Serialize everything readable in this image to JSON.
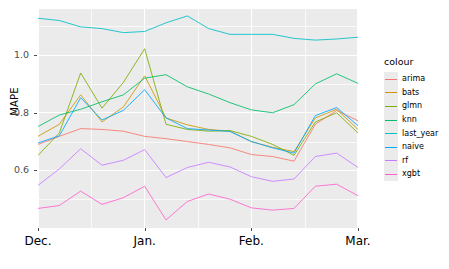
{
  "chart_data": {
    "type": "line",
    "title": "",
    "xlabel": "",
    "ylabel": "MAPE",
    "legend_title": "colour",
    "legend_position": "right",
    "grid": true,
    "ylim": [
      0.4,
      1.16
    ],
    "yticks": [
      0.6,
      0.8,
      1.0
    ],
    "ytick_labels": [
      "0.6",
      "0.8",
      "1.0"
    ],
    "y_minor_ticks": [
      0.5,
      0.7,
      0.9,
      1.1
    ],
    "xticks": [
      "Dec.",
      "Jan.",
      "Feb.",
      "Mar."
    ],
    "xtick_positions": [
      1,
      6,
      11,
      16
    ],
    "x_minor_positions": [
      3.5,
      8.5,
      13.5
    ],
    "x": [
      1,
      2,
      3,
      4,
      5,
      6,
      7,
      8,
      9,
      10,
      11,
      12,
      13,
      14,
      15,
      16
    ],
    "series": [
      {
        "name": "arima",
        "color": "#f8766d",
        "values": [
          0.69,
          0.718,
          0.745,
          0.742,
          0.736,
          0.718,
          0.71,
          0.7,
          0.69,
          0.678,
          0.655,
          0.648,
          0.632,
          0.76,
          0.808,
          0.772
        ]
      },
      {
        "name": "bats",
        "color": "#cd9600",
        "values": [
          0.718,
          0.76,
          0.862,
          0.768,
          0.82,
          0.928,
          0.782,
          0.758,
          0.742,
          0.736,
          0.7,
          0.68,
          0.665,
          0.782,
          0.812,
          0.742
        ]
      },
      {
        "name": "glmn",
        "color": "#7cae00",
        "values": [
          0.652,
          0.73,
          0.938,
          0.816,
          0.905,
          1.022,
          0.76,
          0.742,
          0.736,
          0.738,
          0.718,
          0.69,
          0.652,
          0.768,
          0.8,
          0.73
        ]
      },
      {
        "name": "knn",
        "color": "#00be67",
        "values": [
          0.752,
          0.792,
          0.812,
          0.838,
          0.862,
          0.92,
          0.932,
          0.89,
          0.865,
          0.835,
          0.81,
          0.8,
          0.828,
          0.9,
          0.935,
          0.902
        ]
      },
      {
        "name": "last_year",
        "color": "#00bfc4",
        "values": [
          1.128,
          1.12,
          1.098,
          1.092,
          1.078,
          1.082,
          1.112,
          1.136,
          1.092,
          1.072,
          1.072,
          1.072,
          1.058,
          1.052,
          1.056,
          1.062
        ]
      },
      {
        "name": "naive",
        "color": "#00a9ff",
        "values": [
          0.695,
          0.72,
          0.852,
          0.775,
          0.808,
          0.88,
          0.782,
          0.745,
          0.74,
          0.735,
          0.7,
          0.678,
          0.66,
          0.79,
          0.818,
          0.755
        ]
      },
      {
        "name": "rf",
        "color": "#c77cff",
        "values": [
          0.548,
          0.605,
          0.675,
          0.618,
          0.635,
          0.672,
          0.575,
          0.61,
          0.628,
          0.612,
          0.578,
          0.562,
          0.57,
          0.648,
          0.66,
          0.61
        ]
      },
      {
        "name": "xgbt",
        "color": "#ff61cc",
        "values": [
          0.468,
          0.478,
          0.528,
          0.482,
          0.505,
          0.545,
          0.428,
          0.492,
          0.518,
          0.5,
          0.47,
          0.462,
          0.468,
          0.545,
          0.552,
          0.512
        ]
      }
    ]
  }
}
